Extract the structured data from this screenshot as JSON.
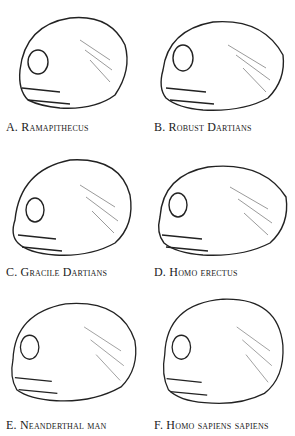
{
  "figure": {
    "panels": [
      {
        "label": "A. Ramapithecus"
      },
      {
        "label": "B. Robust Dartians"
      },
      {
        "label": "C. Gracile Dartians"
      },
      {
        "label": "D. Homo erectus"
      },
      {
        "label": "E. Neanderthal man"
      },
      {
        "label": "F. Homo sapiens sapiens"
      }
    ]
  }
}
